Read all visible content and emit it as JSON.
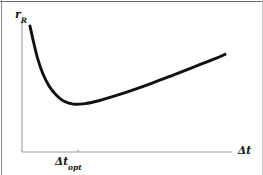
{
  "figure": {
    "width": 263,
    "height": 175,
    "background_color": "#ffffff",
    "border_color": "#6e6e6e"
  },
  "axes": {
    "color": "#9a9a9a",
    "origin": {
      "x": 22,
      "y": 152
    },
    "y_axis_top": 22,
    "x_axis_right": 232,
    "tick": {
      "x": 78,
      "color": "#9a9a9a"
    }
  },
  "labels": {
    "y_axis": {
      "base": "r",
      "subscript": "R",
      "full": "r_R"
    },
    "x_axis": {
      "full": "Δt"
    },
    "x_tick": {
      "base": "Δt",
      "subscript": "opt",
      "full": "Δt_opt"
    }
  },
  "curve": {
    "color": "#111111",
    "stroke_width": 2.9,
    "path": "M 30 26 C 31.6 45 33.6 63 38 78 C 43 95 52 103.5 64 106.2 C 70 107.4 74 107.7 79 107.5 C 95 106.8 113 102 133 94 C 160 83 195 66 225 51"
  },
  "chart_data": {
    "type": "line",
    "title": "",
    "subtitle": "",
    "xlabel": "Δt",
    "ylabel": "r_R",
    "grid": false,
    "legend": null,
    "annotations": [
      {
        "text": "Δt_opt",
        "kind": "x-axis-tick",
        "x_data": 0.245,
        "note": "abscissa of the curve minimum"
      }
    ],
    "axis_ticks": {
      "x": [
        "Δt_opt"
      ],
      "y": []
    },
    "xlim": [
      0,
      1
    ],
    "ylim": [
      0,
      1
    ],
    "series": [
      {
        "name": "total residual error",
        "shape": "convex U-curve with steep left branch and gentle linear right branch",
        "x": [
          0.038,
          0.055,
          0.075,
          0.1,
          0.13,
          0.165,
          0.2,
          0.245,
          0.3,
          0.37,
          0.45,
          0.53,
          0.62,
          0.72,
          0.82,
          0.92,
          0.967
        ],
        "y": [
          0.969,
          0.846,
          0.716,
          0.6,
          0.505,
          0.434,
          0.39,
          0.368,
          0.372,
          0.396,
          0.435,
          0.478,
          0.53,
          0.592,
          0.655,
          0.718,
          0.751
        ],
        "minimum": {
          "x": 0.245,
          "y": 0.368
        }
      }
    ]
  }
}
